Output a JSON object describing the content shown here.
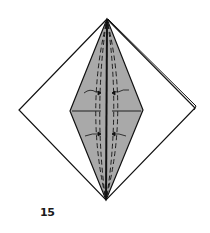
{
  "diagram": {
    "type": "origami-fold-step",
    "step_number": "15",
    "colors": {
      "line": "#111111",
      "paper_front": "#ffffff",
      "paper_colored": "#a9a9a9"
    }
  }
}
